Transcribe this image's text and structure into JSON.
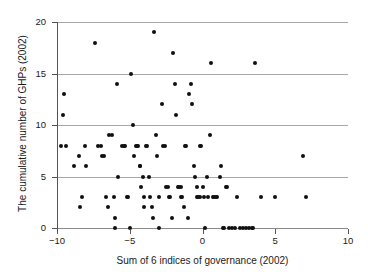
{
  "chart_data": {
    "type": "scatter",
    "title": "",
    "xlabel": "Sum of 6 indices of governance (2002)",
    "ylabel": "The cumulative number of GHPs (2002)",
    "xlim": [
      -10,
      10
    ],
    "ylim": [
      0,
      20
    ],
    "xticks": [
      -10,
      -5,
      0,
      5,
      10
    ],
    "xtick_labels": [
      "−10",
      "−5",
      "0",
      "5",
      "10"
    ],
    "yticks": [
      0,
      5,
      10,
      15,
      20
    ],
    "ytick_labels": [
      "0",
      "5",
      "10",
      "15",
      "20"
    ],
    "grid": "horizontal",
    "legend": null,
    "marker": "filled-circle",
    "marker_color": "#101010",
    "gridline_color": "#a8a8a8",
    "points": [
      [
        -9.5,
        13
      ],
      [
        -9.6,
        11
      ],
      [
        -9.7,
        8
      ],
      [
        -9.4,
        8
      ],
      [
        -8.8,
        6
      ],
      [
        -8.5,
        7
      ],
      [
        -8.4,
        2
      ],
      [
        -8.3,
        3
      ],
      [
        -8.1,
        8
      ],
      [
        -8.0,
        6
      ],
      [
        -7.4,
        18
      ],
      [
        -7.2,
        8
      ],
      [
        -7.0,
        8
      ],
      [
        -6.9,
        7
      ],
      [
        -6.8,
        7
      ],
      [
        -6.6,
        3
      ],
      [
        -6.5,
        2
      ],
      [
        -6.4,
        9
      ],
      [
        -6.2,
        9
      ],
      [
        -6.1,
        3
      ],
      [
        -6.0,
        1
      ],
      [
        -6.0,
        0
      ],
      [
        -5.9,
        14
      ],
      [
        -5.8,
        5
      ],
      [
        -5.5,
        8
      ],
      [
        -5.4,
        8
      ],
      [
        -5.3,
        8
      ],
      [
        -5.2,
        3
      ],
      [
        -5.1,
        3
      ],
      [
        -5.0,
        0
      ],
      [
        -4.9,
        15
      ],
      [
        -4.8,
        10
      ],
      [
        -4.7,
        7
      ],
      [
        -4.6,
        8
      ],
      [
        -4.5,
        8
      ],
      [
        -4.4,
        8
      ],
      [
        -4.3,
        6
      ],
      [
        -4.3,
        6
      ],
      [
        -4.2,
        4
      ],
      [
        -4.1,
        5
      ],
      [
        -4.0,
        3
      ],
      [
        -4.0,
        2
      ],
      [
        -3.9,
        8
      ],
      [
        -3.8,
        8
      ],
      [
        -3.7,
        5
      ],
      [
        -3.6,
        3
      ],
      [
        -3.5,
        2
      ],
      [
        -3.4,
        1
      ],
      [
        -3.3,
        19
      ],
      [
        -3.2,
        9
      ],
      [
        -3.1,
        7
      ],
      [
        -3.0,
        3
      ],
      [
        -3.0,
        0
      ],
      [
        -2.8,
        12
      ],
      [
        -2.7,
        8
      ],
      [
        -2.6,
        8
      ],
      [
        -2.5,
        4
      ],
      [
        -2.4,
        4
      ],
      [
        -2.3,
        3
      ],
      [
        -2.2,
        3
      ],
      [
        -2.1,
        1
      ],
      [
        -2.0,
        17
      ],
      [
        -1.9,
        14
      ],
      [
        -1.8,
        11
      ],
      [
        -1.7,
        4
      ],
      [
        -1.6,
        4
      ],
      [
        -1.5,
        4
      ],
      [
        -1.5,
        3
      ],
      [
        -1.4,
        3
      ],
      [
        -1.3,
        2
      ],
      [
        -1.2,
        8
      ],
      [
        -1.1,
        8
      ],
      [
        -1.0,
        1
      ],
      [
        -0.9,
        13
      ],
      [
        -0.8,
        14
      ],
      [
        -0.7,
        12
      ],
      [
        -0.6,
        6
      ],
      [
        -0.5,
        5
      ],
      [
        -0.4,
        4
      ],
      [
        -0.4,
        3
      ],
      [
        -0.3,
        3
      ],
      [
        -0.2,
        3
      ],
      [
        -0.2,
        8
      ],
      [
        -0.1,
        8
      ],
      [
        0.0,
        4
      ],
      [
        0.1,
        3
      ],
      [
        0.2,
        0
      ],
      [
        0.3,
        5
      ],
      [
        0.4,
        3
      ],
      [
        0.5,
        9
      ],
      [
        0.6,
        16
      ],
      [
        0.7,
        3
      ],
      [
        0.8,
        3
      ],
      [
        0.9,
        3
      ],
      [
        1.0,
        3
      ],
      [
        1.2,
        5
      ],
      [
        1.3,
        6
      ],
      [
        1.4,
        0
      ],
      [
        1.5,
        0
      ],
      [
        1.6,
        4
      ],
      [
        1.7,
        4
      ],
      [
        1.8,
        0
      ],
      [
        2.0,
        0
      ],
      [
        2.2,
        0
      ],
      [
        2.4,
        3
      ],
      [
        2.6,
        0
      ],
      [
        2.8,
        0
      ],
      [
        3.0,
        0
      ],
      [
        3.2,
        0
      ],
      [
        3.4,
        0
      ],
      [
        3.5,
        0
      ],
      [
        3.6,
        16
      ],
      [
        4.0,
        3
      ],
      [
        5.0,
        3
      ],
      [
        6.9,
        7
      ],
      [
        7.1,
        3
      ]
    ]
  },
  "axes": {
    "x_title": "Sum of 6 indices of governance (2002)",
    "y_title": "The cumulative number of GHPs (2002)"
  }
}
